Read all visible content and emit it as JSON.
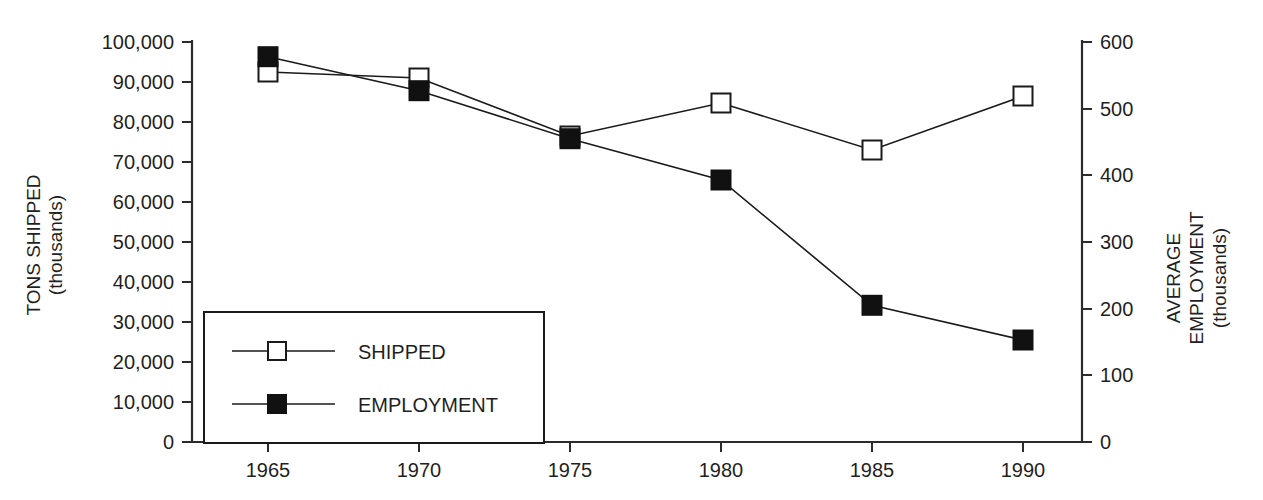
{
  "chart_data": {
    "type": "line",
    "title": "",
    "subtitle": "",
    "xlabel": "",
    "categories": [
      "1965",
      "1970",
      "1975",
      "1980",
      "1985",
      "1990"
    ],
    "x": [
      1965,
      1970,
      1975,
      1980,
      1985,
      1990
    ],
    "grid": false,
    "legend_position": "inside-bottom-left",
    "axes": {
      "left": {
        "label_line1": "TONS SHIPPED",
        "label_line2": "(thousands)",
        "ylim": [
          0,
          100000
        ],
        "tick_step": 10000,
        "tick_labels": [
          "0",
          "10,000",
          "20,000",
          "30,000",
          "40,000",
          "50,000",
          "60,000",
          "70,000",
          "80,000",
          "90,000",
          "100,000"
        ],
        "tick_values": [
          0,
          10000,
          20000,
          30000,
          40000,
          50000,
          60000,
          70000,
          80000,
          90000,
          100000
        ]
      },
      "right": {
        "label_line1": "AVERAGE",
        "label_line2": "EMPLOYMENT",
        "label_line3": "(thousands)",
        "ylim": [
          0,
          600
        ],
        "tick_step": 100,
        "tick_labels": [
          "0",
          "100",
          "200",
          "300",
          "400",
          "500",
          "600"
        ],
        "tick_values": [
          0,
          100,
          200,
          300,
          400,
          500,
          600
        ]
      }
    },
    "series": [
      {
        "name": "SHIPPED",
        "axis": "left",
        "marker": "open-square",
        "marker_color": "#ffffff",
        "line_color": "#1a1a1a",
        "values": [
          92500,
          91000,
          76500,
          84750,
          73000,
          86500
        ]
      },
      {
        "name": "EMPLOYMENT",
        "axis": "right",
        "marker": "filled-square",
        "marker_color": "#111111",
        "line_color": "#1a1a1a",
        "values": [
          578,
          527,
          455,
          393,
          205,
          153
        ]
      }
    ]
  },
  "legend": {
    "items": [
      {
        "label": "SHIPPED",
        "marker": "open-square"
      },
      {
        "label": "EMPLOYMENT",
        "marker": "filled-square"
      }
    ]
  }
}
